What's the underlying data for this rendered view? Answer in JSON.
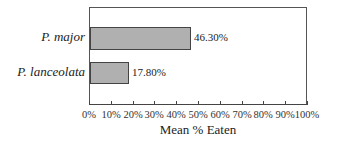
{
  "chart_data": {
    "type": "bar",
    "orientation": "horizontal",
    "title": "",
    "categories": [
      "P. major",
      "P. lanceolata"
    ],
    "values": [
      46.3,
      17.8
    ],
    "value_labels": [
      "46.30%",
      "17.80%"
    ],
    "xlabel": "Mean % Eaten",
    "ylabel": "",
    "xlim": [
      0,
      100
    ],
    "x_ticks": [
      "0%",
      "10%",
      "20%",
      "30%",
      "40%",
      "50%",
      "60%",
      "70%",
      "80%",
      "90%",
      "100%"
    ],
    "grid": false,
    "legend": null,
    "bar_color": "#b0b0b0"
  },
  "labels": {
    "cat0": "P. major",
    "cat1": "P. lanceolata",
    "val0": "46.30%",
    "val1": "17.80%",
    "xlabel": "Mean % Eaten",
    "ticks": [
      "0%",
      "10%",
      "20%",
      "30%",
      "40%",
      "50%",
      "60%",
      "70%",
      "80%",
      "90%",
      "100%"
    ]
  }
}
